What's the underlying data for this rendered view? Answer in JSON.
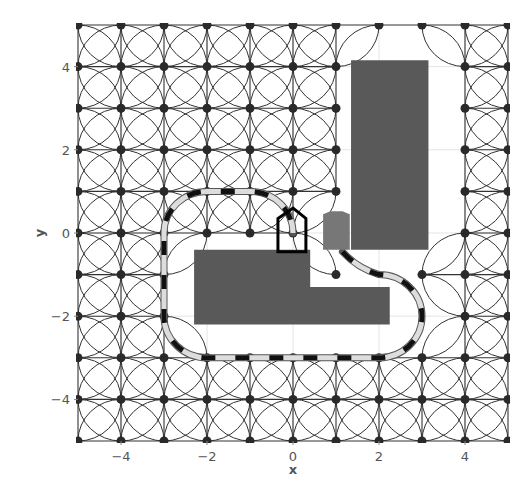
{
  "chart_data": {
    "type": "scatter",
    "title": "",
    "xlabel": "x",
    "ylabel": "y",
    "xlim": [
      -5,
      5
    ],
    "ylim": [
      -5,
      5
    ],
    "grid": true,
    "legend": null,
    "xticks": [
      -4,
      -2,
      0,
      2,
      4
    ],
    "yticks": [
      -4,
      -2,
      0,
      2,
      4
    ],
    "xtick_labels": [
      "−4",
      "−2",
      "0",
      "2",
      "4"
    ],
    "ytick_labels": [
      "−4",
      "−2",
      "0",
      "2",
      "4"
    ],
    "lattice": {
      "description": "State lattice of integer grid nodes connected by straight edges and unit-radius quarter-arc motion primitives",
      "node_range": [
        -5,
        5
      ],
      "arc_radius": 1,
      "missing_nodes": [
        [
          2,
          4
        ],
        [
          3,
          4
        ],
        [
          2,
          3
        ],
        [
          3,
          3
        ],
        [
          2,
          2
        ],
        [
          3,
          2
        ],
        [
          2,
          1
        ],
        [
          3,
          1
        ],
        [
          2,
          0
        ],
        [
          3,
          0
        ],
        [
          1,
          0
        ],
        [
          -2,
          -1
        ],
        [
          -1,
          -1
        ],
        [
          0,
          -1
        ],
        [
          2,
          -1
        ],
        [
          -2,
          -2
        ],
        [
          -1,
          -2
        ],
        [
          0,
          -2
        ],
        [
          1,
          -2
        ],
        [
          2,
          -2
        ],
        [
          3,
          -2
        ]
      ],
      "color": "#333333"
    },
    "obstacles": [
      {
        "name": "tall-rectangle",
        "color": "#595959",
        "polygon": [
          [
            1.35,
            4.15
          ],
          [
            3.15,
            4.15
          ],
          [
            3.15,
            -0.4
          ],
          [
            1.35,
            -0.4
          ]
        ]
      },
      {
        "name": "l-shaped-block",
        "color": "#595959",
        "polygon": [
          [
            -2.3,
            -0.4
          ],
          [
            0.4,
            -0.4
          ],
          [
            0.4,
            -1.3
          ],
          [
            2.25,
            -1.3
          ],
          [
            2.25,
            -2.2
          ],
          [
            -2.3,
            -2.2
          ]
        ]
      }
    ],
    "vehicles": [
      {
        "name": "goal-vehicle-outline",
        "style": "outline",
        "color": "#000000",
        "polygon": [
          [
            -0.35,
            -0.45
          ],
          [
            0.3,
            -0.45
          ],
          [
            0.3,
            0.35
          ],
          [
            0.0,
            0.6
          ],
          [
            -0.35,
            0.35
          ]
        ]
      },
      {
        "name": "start-vehicle-filled",
        "style": "filled",
        "color": "#777777",
        "polygon": [
          [
            0.7,
            -0.4
          ],
          [
            1.32,
            -0.4
          ],
          [
            1.32,
            0.45
          ],
          [
            1.15,
            0.52
          ],
          [
            0.87,
            0.52
          ],
          [
            0.7,
            0.45
          ]
        ]
      }
    ],
    "path": {
      "style": "dashed black/light-gray thick line",
      "colors": [
        "#111111",
        "#dddddd"
      ],
      "segments": [
        {
          "type": "curve",
          "points": [
            [
              1.15,
              -0.45
            ],
            [
              1.5,
              -0.85
            ],
            [
              2.0,
              -1.0
            ]
          ]
        },
        {
          "type": "arc",
          "from": [
            2,
            -1
          ],
          "to": [
            3,
            -2
          ],
          "center": [
            2,
            -2
          ]
        },
        {
          "type": "arc",
          "from": [
            3,
            -2
          ],
          "to": [
            2,
            -3
          ],
          "center": [
            2,
            -2
          ]
        },
        {
          "type": "line",
          "from": [
            2,
            -3
          ],
          "to": [
            -2,
            -3
          ]
        },
        {
          "type": "arc",
          "from": [
            -2,
            -3
          ],
          "to": [
            -3,
            -2
          ],
          "center": [
            -2,
            -2
          ]
        },
        {
          "type": "line",
          "from": [
            -3,
            -2
          ],
          "to": [
            -3,
            0
          ]
        },
        {
          "type": "arc",
          "from": [
            -3,
            0
          ],
          "to": [
            -2,
            1
          ],
          "center": [
            -2,
            0
          ]
        },
        {
          "type": "line",
          "from": [
            -2,
            1
          ],
          "to": [
            -1,
            1
          ]
        },
        {
          "type": "arc",
          "from": [
            -1,
            1
          ],
          "to": [
            0,
            0
          ],
          "center": [
            -1,
            0
          ]
        }
      ]
    }
  },
  "axes": {
    "x_label": "x",
    "y_label": "y"
  }
}
